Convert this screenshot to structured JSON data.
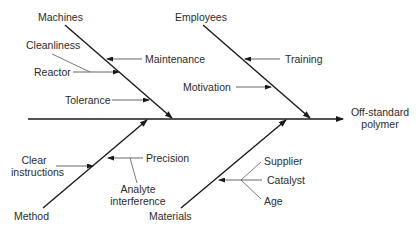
{
  "diagram": {
    "type": "fishbone",
    "effect": {
      "line1": "Off-standard",
      "line2": "polymer"
    },
    "categories": [
      {
        "name": "Machines",
        "causes": [
          "Maintenance",
          "Cleanliness",
          "Reactor",
          "Tolerance"
        ]
      },
      {
        "name": "Employees",
        "causes": [
          "Training",
          "Motivation"
        ]
      },
      {
        "name": "Method",
        "causes": [
          "Clear instructions",
          "Precision",
          "Analyte interference"
        ]
      },
      {
        "name": "Materials",
        "causes": [
          "Supplier",
          "Catalyst",
          "Age"
        ]
      }
    ],
    "labels": {
      "machines": "Machines",
      "employees": "Employees",
      "method": "Method",
      "materials": "Materials",
      "maintenance": "Maintenance",
      "cleanliness": "Cleanliness",
      "reactor": "Reactor",
      "tolerance": "Tolerance",
      "training": "Training",
      "motivation": "Motivation",
      "clear_1": "Clear",
      "clear_2": "instructions",
      "precision": "Precision",
      "analyte_1": "Analyte",
      "analyte_2": "interference",
      "supplier": "Supplier",
      "catalyst": "Catalyst",
      "age": "Age"
    },
    "colors": {
      "line": "#1a1a1a",
      "thin": "#555555",
      "text": "#2b2b2b"
    }
  }
}
